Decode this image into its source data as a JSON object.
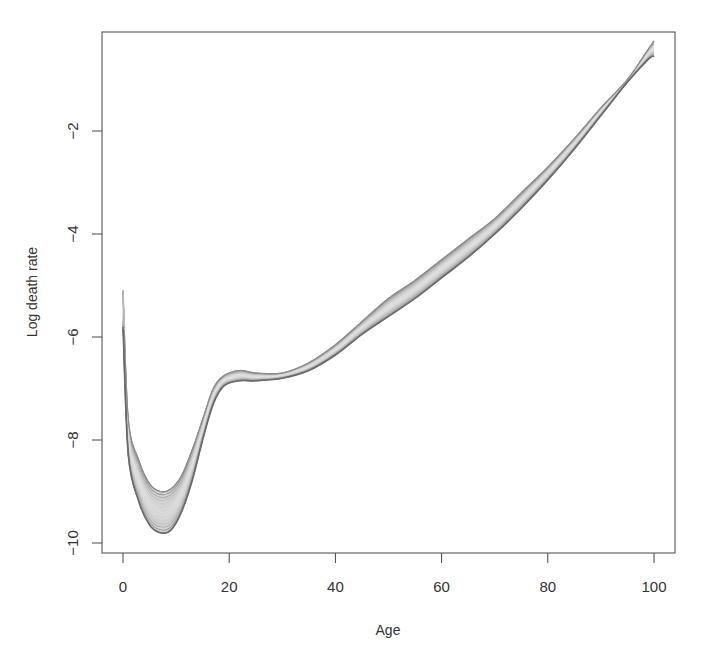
{
  "chart_data": {
    "type": "area",
    "title": "",
    "xlabel": "Age",
    "ylabel": "Log death rate",
    "xlim": [
      -4,
      104
    ],
    "ylim": [
      -10.2,
      0.1
    ],
    "xticks": [
      0,
      20,
      40,
      60,
      80,
      100
    ],
    "xtick_labels": [
      "0",
      "20",
      "40",
      "60",
      "80",
      "100"
    ],
    "yticks": [
      -2,
      -4,
      -6,
      -8,
      -10
    ],
    "ytick_labels": [
      "-2",
      "-4",
      "-6",
      "-8",
      "-10"
    ],
    "grid": false,
    "legend": null,
    "series": [
      {
        "name": "upper envelope",
        "x": [
          0,
          1,
          3,
          5,
          7,
          9,
          11,
          13,
          15,
          17,
          19,
          22,
          25,
          30,
          35,
          40,
          45,
          50,
          55,
          60,
          65,
          70,
          75,
          80,
          85,
          90,
          95,
          99,
          100
        ],
        "values": [
          -5.1,
          -7.6,
          -8.4,
          -8.85,
          -9.0,
          -8.95,
          -8.7,
          -8.2,
          -7.6,
          -7.0,
          -6.75,
          -6.65,
          -6.7,
          -6.7,
          -6.5,
          -6.15,
          -5.7,
          -5.25,
          -4.9,
          -4.5,
          -4.1,
          -3.7,
          -3.2,
          -2.7,
          -2.15,
          -1.55,
          -1.0,
          -0.4,
          -0.25
        ]
      },
      {
        "name": "lower envelope",
        "x": [
          0,
          1,
          3,
          5,
          7,
          9,
          11,
          13,
          15,
          17,
          19,
          22,
          25,
          30,
          35,
          40,
          45,
          50,
          55,
          60,
          65,
          70,
          75,
          80,
          85,
          90,
          95,
          99,
          100
        ],
        "values": [
          -5.8,
          -8.3,
          -9.2,
          -9.65,
          -9.8,
          -9.75,
          -9.4,
          -8.8,
          -8.0,
          -7.3,
          -6.95,
          -6.85,
          -6.85,
          -6.8,
          -6.65,
          -6.35,
          -5.95,
          -5.6,
          -5.25,
          -4.85,
          -4.45,
          -4.0,
          -3.5,
          -2.95,
          -2.35,
          -1.7,
          -1.05,
          -0.6,
          -0.55
        ]
      }
    ],
    "colors": {
      "band_fill": "#d4d4d4",
      "band_edge": "#7a7a7a",
      "axis": "#444444"
    }
  }
}
